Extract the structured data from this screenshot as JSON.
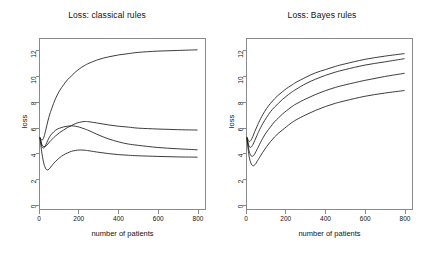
{
  "figure": {
    "width": 429,
    "height": 258,
    "background": "#ffffff",
    "line_color": "#1a1a1a",
    "axis_color": "#8a8a8a"
  },
  "chart_data": [
    {
      "type": "line",
      "title": "Loss: classical rules",
      "xlabel": "number of patients",
      "ylabel": "loss",
      "xlim": [
        0,
        840
      ],
      "ylim": [
        -0.35,
        13.0
      ],
      "xticks": [
        0,
        200,
        400,
        600,
        800
      ],
      "xtick_labels": [
        "0",
        "200",
        "400",
        "600",
        "800"
      ],
      "yticks": [
        0,
        2,
        4,
        6,
        8,
        10,
        12
      ],
      "ytick_labels": [
        "0",
        "2",
        "4",
        "6",
        "8",
        "10",
        "12"
      ],
      "grid": false,
      "legend": "none",
      "x": [
        0,
        10,
        20,
        30,
        40,
        50,
        60,
        80,
        100,
        120,
        140,
        160,
        180,
        200,
        225,
        250,
        300,
        350,
        400,
        450,
        500,
        600,
        700,
        800
      ],
      "series": [
        {
          "name": "curve-1",
          "values": [
            5.25,
            5.05,
            5.3,
            5.9,
            6.55,
            7.1,
            7.55,
            8.35,
            8.95,
            9.4,
            9.8,
            10.1,
            10.4,
            10.65,
            10.9,
            11.1,
            11.4,
            11.6,
            11.75,
            11.85,
            11.95,
            12.05,
            12.1,
            12.15
          ]
        },
        {
          "name": "curve-2",
          "values": [
            5.25,
            4.7,
            4.55,
            4.6,
            4.75,
            4.95,
            5.1,
            5.4,
            5.65,
            5.85,
            6.05,
            6.2,
            6.35,
            6.45,
            6.52,
            6.5,
            6.38,
            6.25,
            6.15,
            6.08,
            6.0,
            5.93,
            5.88,
            5.85
          ]
        },
        {
          "name": "curve-3",
          "values": [
            5.25,
            4.55,
            4.45,
            4.7,
            5.05,
            5.35,
            5.55,
            5.85,
            6.0,
            6.1,
            6.15,
            6.18,
            6.15,
            6.08,
            5.95,
            5.8,
            5.45,
            5.15,
            4.92,
            4.75,
            4.65,
            4.48,
            4.38,
            4.3
          ]
        },
        {
          "name": "curve-4",
          "values": [
            5.2,
            4.0,
            3.2,
            2.8,
            2.72,
            2.85,
            3.05,
            3.4,
            3.68,
            3.9,
            4.05,
            4.18,
            4.25,
            4.28,
            4.27,
            4.22,
            4.1,
            4.0,
            3.92,
            3.87,
            3.83,
            3.78,
            3.74,
            3.72
          ]
        }
      ]
    },
    {
      "type": "line",
      "title": "Loss: Bayes rules",
      "xlabel": "number of patients",
      "ylabel": "loss",
      "xlim": [
        0,
        840
      ],
      "ylim": [
        -0.35,
        13.0
      ],
      "xticks": [
        0,
        200,
        400,
        600,
        800
      ],
      "xtick_labels": [
        "0",
        "200",
        "400",
        "600",
        "800"
      ],
      "yticks": [
        0,
        2,
        4,
        6,
        8,
        10,
        12
      ],
      "ytick_labels": [
        "0",
        "2",
        "4",
        "6",
        "8",
        "10",
        "12"
      ],
      "grid": false,
      "legend": "none",
      "x": [
        0,
        10,
        20,
        30,
        40,
        50,
        60,
        80,
        100,
        120,
        140,
        160,
        180,
        200,
        225,
        250,
        300,
        350,
        400,
        450,
        500,
        600,
        700,
        800
      ],
      "series": [
        {
          "name": "curve-1",
          "values": [
            5.3,
            4.95,
            5.05,
            5.35,
            5.75,
            6.1,
            6.45,
            7.05,
            7.55,
            7.95,
            8.3,
            8.6,
            8.85,
            9.1,
            9.35,
            9.6,
            10.0,
            10.35,
            10.6,
            10.85,
            11.05,
            11.4,
            11.65,
            11.85
          ]
        },
        {
          "name": "curve-2",
          "values": [
            5.25,
            4.6,
            4.5,
            4.7,
            5.05,
            5.4,
            5.75,
            6.35,
            6.85,
            7.3,
            7.65,
            7.95,
            8.25,
            8.5,
            8.8,
            9.05,
            9.5,
            9.85,
            10.15,
            10.4,
            10.6,
            10.95,
            11.2,
            11.45
          ]
        },
        {
          "name": "curve-3",
          "values": [
            5.2,
            4.25,
            3.85,
            3.8,
            4.0,
            4.3,
            4.6,
            5.2,
            5.7,
            6.1,
            6.5,
            6.8,
            7.1,
            7.35,
            7.65,
            7.9,
            8.3,
            8.65,
            8.95,
            9.2,
            9.4,
            9.75,
            10.05,
            10.3
          ]
        },
        {
          "name": "curve-4",
          "values": [
            5.15,
            3.85,
            3.25,
            3.05,
            3.12,
            3.35,
            3.6,
            4.1,
            4.55,
            4.95,
            5.3,
            5.6,
            5.85,
            6.1,
            6.4,
            6.65,
            7.05,
            7.4,
            7.7,
            7.95,
            8.15,
            8.5,
            8.75,
            8.95
          ]
        }
      ]
    }
  ]
}
